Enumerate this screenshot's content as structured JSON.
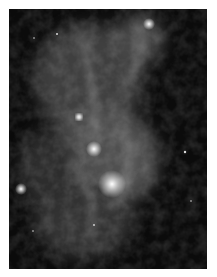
{
  "image": {
    "subject": "grayscale astronomical nebula with bright filamentary gas clouds",
    "colors": {
      "background": "#ffffff",
      "sky": "#0b0b0b",
      "glow": "#e8e8e8"
    }
  }
}
